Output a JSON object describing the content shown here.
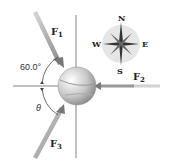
{
  "diagram": {
    "forces": [
      {
        "name": "F",
        "sub": "1"
      },
      {
        "name": "F",
        "sub": "2"
      },
      {
        "name": "F",
        "sub": "3"
      }
    ],
    "angles": {
      "upper": "60.0°",
      "lower": "θ"
    },
    "compass": {
      "n": "N",
      "s": "S",
      "e": "E",
      "w": "W"
    },
    "colors": {
      "arrow": "#9a9a9a",
      "axis": "#555555",
      "compass_bg": "#e6e6e6"
    }
  }
}
